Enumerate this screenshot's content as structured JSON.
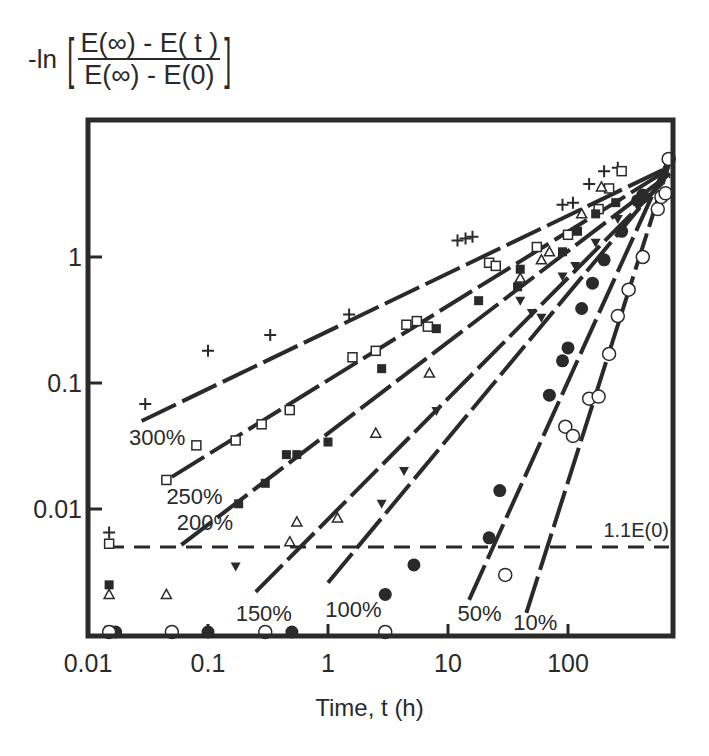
{
  "chart_data": {
    "type": "scatter",
    "title": "",
    "ylabel": {
      "prefix": "-ln",
      "numerator": "E(∞) - E( t )",
      "denominator": "E(∞) - E(0)"
    },
    "xlabel": "Time, t (h)",
    "xscale": "log",
    "yscale": "log",
    "xlim": [
      0.01,
      750
    ],
    "ylim": [
      0.001,
      12
    ],
    "x_ticks": [
      {
        "v": 0.01,
        "label": "0.01"
      },
      {
        "v": 0.1,
        "label": "0.1"
      },
      {
        "v": 1,
        "label": "1"
      },
      {
        "v": 10,
        "label": "10"
      },
      {
        "v": 100,
        "label": "100"
      }
    ],
    "y_ticks": [
      {
        "v": 0.01,
        "label": "0.01"
      },
      {
        "v": 0.1,
        "label": "0.1"
      },
      {
        "v": 1,
        "label": "1"
      }
    ],
    "grid": false,
    "reference_line": {
      "label": "1.1E(0)",
      "y": 0.005,
      "style": "dashed"
    },
    "series": [
      {
        "name": "300%",
        "marker": "plus",
        "fit": [
          [
            0.028,
            0.05
          ],
          [
            700,
            5.2
          ]
        ],
        "label_pos": [
          0.022,
          0.032
        ],
        "points": [
          [
            0.015,
            0.0065
          ],
          [
            0.03,
            0.068
          ],
          [
            0.1,
            0.18
          ],
          [
            0.33,
            0.24
          ],
          [
            1.5,
            0.35
          ],
          [
            12,
            1.35
          ],
          [
            14,
            1.4
          ],
          [
            16,
            1.45
          ],
          [
            90,
            2.6
          ],
          [
            110,
            2.7
          ],
          [
            150,
            3.8
          ],
          [
            200,
            4.8
          ],
          [
            260,
            5.1
          ]
        ]
      },
      {
        "name": "250%",
        "marker": "square-open",
        "fit": [
          [
            0.05,
            0.018
          ],
          [
            700,
            5.0
          ]
        ],
        "label_pos": [
          0.045,
          0.011
        ],
        "points": [
          [
            0.015,
            0.0053
          ],
          [
            0.045,
            0.017
          ],
          [
            0.08,
            0.032
          ],
          [
            0.17,
            0.035
          ],
          [
            0.28,
            0.047
          ],
          [
            0.48,
            0.061
          ],
          [
            1.6,
            0.16
          ],
          [
            2.5,
            0.18
          ],
          [
            4.5,
            0.29
          ],
          [
            5.5,
            0.31
          ],
          [
            6.8,
            0.28
          ],
          [
            22,
            0.9
          ],
          [
            25,
            0.85
          ],
          [
            55,
            1.2
          ],
          [
            100,
            1.5
          ],
          [
            180,
            2.4
          ],
          [
            220,
            3.5
          ],
          [
            280,
            4.8
          ]
        ]
      },
      {
        "name": "200%",
        "marker": "square-filled",
        "fit": [
          [
            0.06,
            0.0052
          ],
          [
            720,
            4.6
          ]
        ],
        "label_pos": [
          0.055,
          0.0068
        ],
        "points": [
          [
            0.015,
            0.0025
          ],
          [
            0.18,
            0.011
          ],
          [
            0.3,
            0.016
          ],
          [
            0.45,
            0.027
          ],
          [
            0.55,
            0.027
          ],
          [
            1,
            0.034
          ],
          [
            2.8,
            0.13
          ],
          [
            8,
            0.27
          ],
          [
            18,
            0.45
          ],
          [
            38,
            0.58
          ],
          [
            40,
            0.8
          ],
          [
            90,
            1.1
          ],
          [
            120,
            1.6
          ],
          [
            170,
            2.2
          ],
          [
            250,
            2.7
          ]
        ]
      },
      {
        "name": "150%",
        "marker": "triangle-open",
        "fit": [
          [
            0.25,
            0.0022
          ],
          [
            700,
            4.4
          ]
        ],
        "label_pos": [
          0.17,
          0.0013
        ],
        "points": [
          [
            0.015,
            0.0021
          ],
          [
            0.045,
            0.0021
          ],
          [
            0.48,
            0.0055
          ],
          [
            0.55,
            0.0079
          ],
          [
            1.2,
            0.0085
          ],
          [
            2.5,
            0.04
          ],
          [
            7,
            0.12
          ],
          [
            40,
            0.68
          ],
          [
            60,
            0.95
          ],
          [
            70,
            1.1
          ],
          [
            130,
            2.2
          ],
          [
            190,
            3.6
          ]
        ]
      },
      {
        "name": "100%",
        "marker": "triangle-filled",
        "fit": [
          [
            1.0,
            0.0026
          ],
          [
            740,
            4.8
          ]
        ],
        "label_pos": [
          0.95,
          0.0014
        ],
        "points": [
          [
            0.015,
            0.0011
          ],
          [
            0.17,
            0.0035
          ],
          [
            2.8,
            0.011
          ],
          [
            4.3,
            0.02
          ],
          [
            8,
            0.06
          ],
          [
            40,
            0.45
          ],
          [
            50,
            0.36
          ],
          [
            60,
            0.33
          ],
          [
            90,
            0.7
          ],
          [
            115,
            0.85
          ],
          [
            170,
            1.3
          ],
          [
            260,
            2.0
          ],
          [
            380,
            2.8
          ]
        ]
      },
      {
        "name": "50%",
        "marker": "circle-filled",
        "fit": [
          [
            15,
            0.0019
          ],
          [
            760,
            6.3
          ]
        ],
        "label_pos": [
          12,
          0.0013
        ],
        "points": [
          [
            0.017,
            0.001
          ],
          [
            0.1,
            0.001
          ],
          [
            0.5,
            0.001
          ],
          [
            3,
            0.0021
          ],
          [
            5.2,
            0.0036
          ],
          [
            22,
            0.0059
          ],
          [
            27,
            0.014
          ],
          [
            70,
            0.08
          ],
          [
            90,
            0.15
          ],
          [
            100,
            0.19
          ],
          [
            130,
            0.39
          ],
          [
            160,
            0.62
          ],
          [
            200,
            0.95
          ],
          [
            280,
            1.6
          ],
          [
            380,
            2.8
          ],
          [
            420,
            3.1
          ]
        ]
      },
      {
        "name": "10%",
        "marker": "circle-open",
        "fit": [
          [
            45,
            0.0015
          ],
          [
            780,
            5.8
          ]
        ],
        "label_pos": [
          35,
          0.0011
        ],
        "points": [
          [
            0.015,
            0.001
          ],
          [
            0.05,
            0.001
          ],
          [
            0.3,
            0.001
          ],
          [
            3,
            0.001
          ],
          [
            30,
            0.003
          ],
          [
            95,
            0.045
          ],
          [
            110,
            0.038
          ],
          [
            150,
            0.075
          ],
          [
            180,
            0.078
          ],
          [
            220,
            0.17
          ],
          [
            260,
            0.34
          ],
          [
            320,
            0.55
          ],
          [
            420,
            1.0
          ],
          [
            560,
            2.4
          ],
          [
            600,
            3.0
          ],
          [
            650,
            3.2
          ],
          [
            690,
            6.0
          ]
        ]
      }
    ]
  }
}
